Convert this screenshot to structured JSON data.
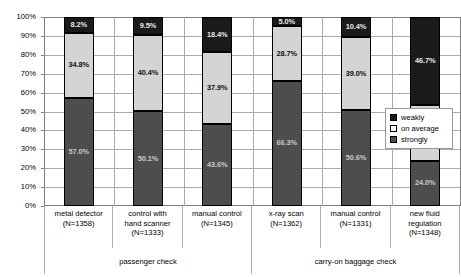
{
  "chart_data": {
    "type": "bar",
    "title": "",
    "subtitle": "",
    "xlabel": "",
    "ylabel": "",
    "ylim": [
      0,
      100
    ],
    "grid": true,
    "stacked": true,
    "stack_mode": "percent",
    "legend_position": "right-inside",
    "y_ticks": [
      "0%",
      "10%",
      "20%",
      "30%",
      "40%",
      "50%",
      "60%",
      "70%",
      "80%",
      "90%",
      "100%"
    ],
    "y_tick_values": [
      0,
      10,
      20,
      30,
      40,
      50,
      60,
      70,
      80,
      90,
      100
    ],
    "categories": [
      "metal detector",
      "control with hand scanner",
      "manual control",
      "x-ray scan",
      "manual control",
      "new fluid regulation"
    ],
    "category_lines": [
      [
        "metal detector",
        "(N=1358)"
      ],
      [
        "control with",
        "hand scanner",
        "(N=1333)"
      ],
      [
        "manual control",
        "(N=1345)"
      ],
      [
        "x-ray scan",
        "(N=1362)"
      ],
      [
        "manual control",
        "(N=1331)"
      ],
      [
        "new fluid",
        "regulation",
        "(N=1348)"
      ]
    ],
    "sample_sizes": [
      1358,
      1333,
      1345,
      1362,
      1331,
      1348
    ],
    "groups": [
      {
        "label": "passenger check",
        "span": 3
      },
      {
        "label": "carry-on baggage check",
        "span": 3
      }
    ],
    "series": [
      {
        "name": "strongly",
        "color": "#4d4d4d",
        "values": [
          57.0,
          50.1,
          43.6,
          66.3,
          50.6,
          24.0
        ],
        "labels": [
          "57.0%",
          "50.1%",
          "43.6%",
          "66.3%",
          "50.6%",
          "24.0%"
        ]
      },
      {
        "name": "on average",
        "color": "#d4d4d4",
        "values": [
          34.8,
          40.4,
          37.9,
          28.7,
          39.0,
          29.3
        ],
        "labels": [
          "34.8%",
          "40.4%",
          "37.9%",
          "28.7%",
          "39.0%",
          "29.3%"
        ]
      },
      {
        "name": "weakly",
        "color": "#1a1a1a",
        "values": [
          8.2,
          9.5,
          18.4,
          5.0,
          10.4,
          46.7
        ],
        "labels": [
          "8.2%",
          "9.5%",
          "18.4%",
          "5.0%",
          "10.4%",
          "46.7%"
        ]
      }
    ],
    "legend": [
      {
        "label": "weakly",
        "swatch": "weakly"
      },
      {
        "label": "on average",
        "swatch": "average"
      },
      {
        "label": "strongly",
        "swatch": "strongly"
      }
    ]
  }
}
